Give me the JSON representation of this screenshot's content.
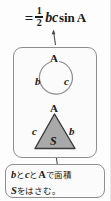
{
  "figure": {
    "background_color": "#fdfdfd",
    "line_color": "#8e8e8e",
    "text_color": "#1a1a1a",
    "triangle_fill_color": "#a9a9a9",
    "triangle_stroke_color": "#3a3a3a"
  },
  "formula": {
    "equals": "=",
    "fraction_numerator": "1",
    "fraction_denominator": "2",
    "variables": "bc",
    "function": "sin",
    "angle": "A",
    "full_text": "= 1/2 bc sin A"
  },
  "arc_diagram": {
    "angle_label": "A",
    "left_side_label": "b",
    "right_side_label": "c"
  },
  "triangle_diagram": {
    "apex_label": "A",
    "left_side_label": "c",
    "right_side_label": "b",
    "area_label": "S"
  },
  "caption": {
    "line1_var1": "b",
    "line1_text1": "と",
    "line1_var2": "c",
    "line1_text2": "と",
    "line1_var3": "A",
    "line1_text3": "で面積",
    "line2_var1": "S",
    "line2_text1": "をはさむ。",
    "full_text": "b と c と A で面積 S をはさむ。"
  },
  "arrows": {
    "caption_to_triangle": "arrow pointing up from caption box to triangle",
    "arc_to_formula": "arrow pointing up from arc diagram to formula"
  }
}
